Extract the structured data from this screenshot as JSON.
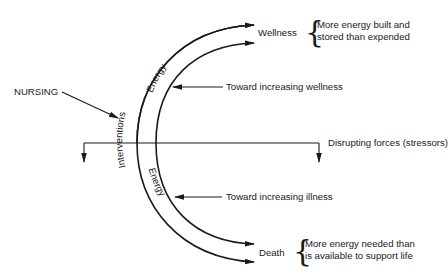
{
  "diagram": {
    "type": "energy-continuum",
    "nodes": {
      "wellness": {
        "label": "Wellness",
        "description_line1": "More energy built and",
        "description_line2": "stored than expended"
      },
      "death": {
        "label": "Death",
        "description_line1": "More energy needed than",
        "description_line2": "is available to support life"
      },
      "nursing": {
        "label": "NURSING"
      }
    },
    "arc_labels": {
      "outer_band": "Interventions",
      "inner_upper": "Energy",
      "inner_lower": "Energy"
    },
    "arrow_labels": {
      "toward_wellness": "Toward increasing wellness",
      "disrupting": "Disrupting forces (stressors)",
      "toward_illness": "Toward increasing illness"
    },
    "colors": {
      "stroke": "#1a1a1a",
      "background": "#ffffff"
    }
  }
}
